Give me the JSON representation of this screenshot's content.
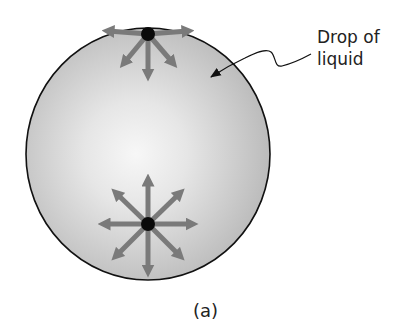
{
  "figure": {
    "label_line1": "Drop of",
    "label_line2": "liquid",
    "caption": "(a)"
  },
  "drop": {
    "cx": 148,
    "cy": 154,
    "rx": 122,
    "ry": 126,
    "edge_color": "#111111",
    "fill_light": "#f4f4f4",
    "fill_dark": "#b9b9b9"
  },
  "molecules": [
    {
      "name": "surface-molecule",
      "x": 148,
      "y": 34,
      "force_directions": [
        "left",
        "right",
        "down-left",
        "down",
        "down-right"
      ]
    },
    {
      "name": "interior-molecule",
      "x": 148,
      "y": 224,
      "force_directions": [
        "up",
        "up-right",
        "right",
        "down-right",
        "down",
        "down-left",
        "left",
        "up-left"
      ]
    }
  ],
  "colors": {
    "arrow": "#7a7a7a",
    "dot": "#0a0a0a",
    "text": "#222222"
  }
}
